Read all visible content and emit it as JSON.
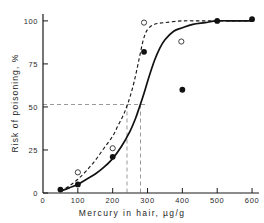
{
  "chart_data": {
    "type": "line",
    "title": "",
    "xlabel": "Mercury in hair,   µg/g",
    "ylabel": "Risk of poisoning,   %",
    "xlim": [
      0,
      620
    ],
    "ylim": [
      0,
      104
    ],
    "xticks": [
      0,
      100,
      200,
      300,
      400,
      500,
      600
    ],
    "xtick_labels": [
      "0",
      "100",
      "200",
      "300",
      "400",
      "500",
      "600"
    ],
    "yticks": [
      0,
      25,
      50,
      75,
      100
    ],
    "ytick_labels": [
      "0",
      "25",
      "50",
      "75",
      "100"
    ],
    "grid": false,
    "legend": "none",
    "series": [
      {
        "name": "open-circle-observations",
        "marker": "open-circle",
        "style": "dashed-fitted-curve",
        "x": [
          100,
          200,
          290,
          397
        ],
        "y": [
          12,
          26,
          99,
          88
        ]
      },
      {
        "name": "filled-circle-observations",
        "marker": "filled-circle",
        "style": "solid-fitted-curve",
        "x": [
          50,
          100,
          200,
          290,
          400,
          500,
          600
        ],
        "y": [
          2,
          5,
          21,
          82,
          60,
          100,
          101
        ]
      }
    ],
    "fitted_curves": [
      {
        "name": "dashed-sigmoid",
        "dash": true,
        "ed50_x": 240,
        "points": [
          [
            50,
            1
          ],
          [
            75,
            4
          ],
          [
            100,
            8
          ],
          [
            125,
            13
          ],
          [
            150,
            19
          ],
          [
            175,
            26
          ],
          [
            200,
            33
          ],
          [
            215,
            39
          ],
          [
            230,
            45
          ],
          [
            240,
            50
          ],
          [
            250,
            56
          ],
          [
            262,
            65
          ],
          [
            275,
            77
          ],
          [
            288,
            89
          ],
          [
            300,
            95
          ],
          [
            320,
            98
          ],
          [
            350,
            99
          ],
          [
            400,
            100
          ],
          [
            450,
            100
          ],
          [
            500,
            100
          ],
          [
            550,
            100
          ],
          [
            600,
            100
          ]
        ]
      },
      {
        "name": "solid-sigmoid",
        "dash": false,
        "ed50_x": 277,
        "points": [
          [
            50,
            1
          ],
          [
            75,
            3
          ],
          [
            100,
            5
          ],
          [
            125,
            8
          ],
          [
            150,
            11
          ],
          [
            175,
            15
          ],
          [
            200,
            20
          ],
          [
            225,
            27
          ],
          [
            250,
            36
          ],
          [
            265,
            43
          ],
          [
            277,
            50
          ],
          [
            290,
            58
          ],
          [
            305,
            68
          ],
          [
            320,
            77
          ],
          [
            335,
            84
          ],
          [
            350,
            89
          ],
          [
            375,
            94
          ],
          [
            400,
            96
          ],
          [
            430,
            98
          ],
          [
            465,
            99
          ],
          [
            500,
            100
          ],
          [
            550,
            100
          ],
          [
            600,
            100
          ]
        ]
      }
    ],
    "reference_lines": [
      {
        "name": "risk-50-horizontal",
        "orientation": "horizontal",
        "value": 50,
        "dashed": true
      },
      {
        "name": "ed50-dashed-curve-vertical",
        "orientation": "vertical",
        "value": 240,
        "dashed": true
      },
      {
        "name": "ed50-solid-curve-vertical",
        "orientation": "vertical",
        "value": 277,
        "dashed": true
      }
    ],
    "colors": {
      "axis": "#1a1a1a",
      "curve": "#1a1a1a",
      "reference": "#8d8d8d",
      "marker_fill": "#111111",
      "marker_open": "#ffffff",
      "background": "#ffffff"
    }
  }
}
